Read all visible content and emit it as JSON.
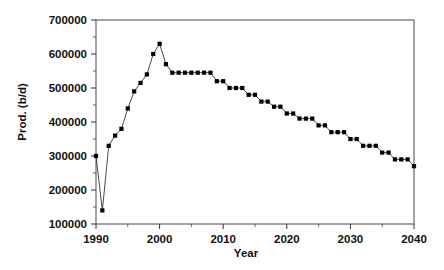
{
  "chart_data": {
    "type": "line",
    "title": "",
    "subtitle": "",
    "xlabel": "Year",
    "ylabel": "Prod. (b/d)",
    "xlim": [
      1990,
      2040
    ],
    "ylim": [
      100000,
      700000
    ],
    "grid": false,
    "legend": false,
    "marker_style": "filled-square",
    "line_style": "thin-solid",
    "x_major_ticks": [
      1990,
      2000,
      2010,
      2020,
      2030,
      2040
    ],
    "x_major_tick_labels": [
      "1990",
      "2000",
      "2010",
      "2020",
      "2030",
      "2040"
    ],
    "x_minor_ticks": [
      1995,
      2005,
      2015,
      2025,
      2035
    ],
    "y_major_ticks": [
      100000,
      200000,
      300000,
      400000,
      500000,
      600000,
      700000
    ],
    "y_major_tick_labels": [
      "100000",
      "200000",
      "300000",
      "400000",
      "500000",
      "600000",
      "700000"
    ],
    "y_minor_ticks": [
      150000,
      250000,
      350000,
      450000,
      550000,
      650000
    ],
    "series": [
      {
        "name": "Production",
        "x": [
          1990,
          1991,
          1992,
          1993,
          1994,
          1995,
          1996,
          1997,
          1998,
          1999,
          2000,
          2001,
          2002,
          2003,
          2004,
          2005,
          2006,
          2007,
          2008,
          2009,
          2010,
          2011,
          2012,
          2013,
          2014,
          2015,
          2016,
          2017,
          2018,
          2019,
          2020,
          2021,
          2022,
          2023,
          2024,
          2025,
          2026,
          2027,
          2028,
          2029,
          2030,
          2031,
          2032,
          2033,
          2034,
          2035,
          2036,
          2037,
          2038,
          2039,
          2040
        ],
        "values": [
          300000,
          140000,
          330000,
          360000,
          380000,
          440000,
          490000,
          515000,
          540000,
          600000,
          630000,
          570000,
          545000,
          545000,
          545000,
          545000,
          545000,
          545000,
          545000,
          520000,
          520000,
          500000,
          500000,
          500000,
          480000,
          480000,
          460000,
          460000,
          445000,
          445000,
          425000,
          425000,
          410000,
          410000,
          410000,
          390000,
          390000,
          370000,
          370000,
          370000,
          350000,
          350000,
          330000,
          330000,
          330000,
          310000,
          310000,
          290000,
          290000,
          290000,
          270000
        ]
      }
    ],
    "annotations": []
  },
  "axes": {
    "y_title": "Prod. (b/d)",
    "x_title": "Year"
  },
  "colors": {
    "marker": "#000000",
    "line": "#1a1a1a",
    "frame": "#4a4a4a",
    "text": "#111111",
    "background": "#ffffff"
  }
}
